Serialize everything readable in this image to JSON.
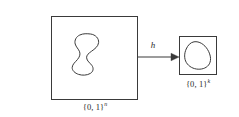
{
  "figure": {
    "domain_box": {
      "label_set": "{0, 1}",
      "label_exponent": "n",
      "blob_name": "irregular-blob-shape"
    },
    "codomain_box": {
      "label_set": "{0, 1}",
      "label_exponent": "k",
      "blob_name": "egg-blob-shape"
    },
    "arrow": {
      "label": "h"
    },
    "colors": {
      "stroke": "#3a3a3a",
      "background": "#ffffff",
      "text": "#2b2b2b"
    }
  }
}
